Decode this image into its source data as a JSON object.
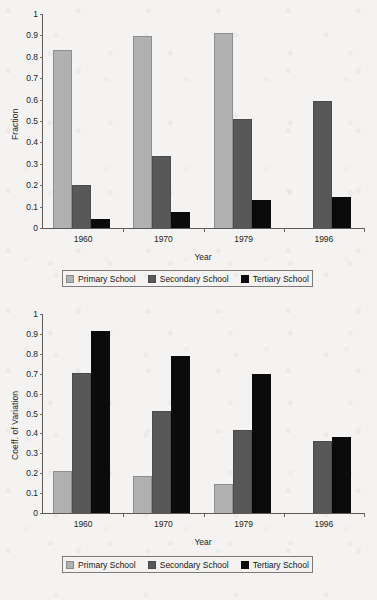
{
  "figure": {
    "background_color": "#f4f3f1",
    "panel_count": 2
  },
  "colors": {
    "primary": "#b1b1b1",
    "secondary": "#585858",
    "tertiary": "#0b0b0b",
    "axis": "#5a5a5a",
    "text": "#1a1a1a"
  },
  "legend": {
    "items": [
      {
        "label": "Primary School",
        "key": "primary"
      },
      {
        "label": "Secondary School",
        "key": "secondary"
      },
      {
        "label": "Tertiary School",
        "key": "tertiary"
      }
    ]
  },
  "chart_data": [
    {
      "type": "bar",
      "title": "",
      "xlabel": "Year",
      "ylabel": "Fraction",
      "categories": [
        "1960",
        "1970",
        "1979",
        "1996"
      ],
      "ylim": [
        0,
        1
      ],
      "yticks": [
        "0",
        "0.1",
        "0.2",
        "0.3",
        "0.4",
        "0.5",
        "0.6",
        "0.7",
        "0.8",
        "0.9",
        "1"
      ],
      "ytick_values": [
        0,
        0.1,
        0.2,
        0.3,
        0.4,
        0.5,
        0.6,
        0.7,
        0.8,
        0.9,
        1
      ],
      "grid": false,
      "legend_position": "below",
      "series": [
        {
          "name": "Primary School",
          "values": [
            0.83,
            0.895,
            0.91,
            null
          ]
        },
        {
          "name": "Secondary School",
          "values": [
            0.202,
            0.335,
            0.51,
            0.592
          ]
        },
        {
          "name": "Tertiary School",
          "values": [
            0.042,
            0.077,
            0.129,
            0.143
          ]
        }
      ]
    },
    {
      "type": "bar",
      "title": "",
      "xlabel": "Year",
      "ylabel": "Coeff. of Variation",
      "categories": [
        "1960",
        "1970",
        "1979",
        "1996"
      ],
      "ylim": [
        0,
        1
      ],
      "yticks": [
        "0",
        "0.1",
        "0.2",
        "0.3",
        "0.4",
        "0.5",
        "0.6",
        "0.7",
        "0.8",
        "0.9",
        "1"
      ],
      "ytick_values": [
        0,
        0.1,
        0.2,
        0.3,
        0.4,
        0.5,
        0.6,
        0.7,
        0.8,
        0.9,
        1
      ],
      "grid": false,
      "legend_position": "below",
      "series": [
        {
          "name": "Primary School",
          "values": [
            0.213,
            0.185,
            0.147,
            null
          ]
        },
        {
          "name": "Secondary School",
          "values": [
            0.703,
            0.515,
            0.419,
            0.362
          ]
        },
        {
          "name": "Tertiary School",
          "values": [
            0.913,
            0.787,
            0.7,
            0.383
          ]
        }
      ]
    }
  ]
}
